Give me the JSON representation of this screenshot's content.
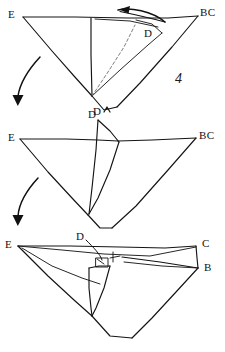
{
  "document": {
    "kind": "hand-drawn origami folding instruction sketch",
    "background_color": "#ffffff",
    "ink_color": "#141414",
    "crease_color": "#6e6e6e",
    "width": 225,
    "height": 352
  },
  "step_number": {
    "text": "4"
  },
  "panels": [
    {
      "id": "panel-top",
      "name": "step-4-before-fold",
      "labels": [
        {
          "name": "vertex-label-e",
          "text": "E",
          "x": 8,
          "y": 14
        },
        {
          "name": "vertex-label-bc",
          "text": "BC",
          "x": 200,
          "y": 12
        },
        {
          "name": "vertex-label-d-flap",
          "text": "D",
          "x": 144,
          "y": 31
        },
        {
          "name": "vertex-label-d-bottom",
          "text": "D",
          "x": 96,
          "y": 107
        }
      ],
      "motion_arrow": {
        "name": "fold-direction-arrow-left",
        "direction": "left",
        "style": "curved-solid-head"
      }
    },
    {
      "id": "panel-middle",
      "name": "step-4-mid-fold",
      "labels": [
        {
          "name": "vertex-label-e",
          "text": "E",
          "x": 8,
          "y": 132
        },
        {
          "name": "vertex-label-bc",
          "text": "BC",
          "x": 200,
          "y": 131
        },
        {
          "name": "vertex-label-d",
          "text": "D",
          "x": 88,
          "y": 114
        }
      ]
    },
    {
      "id": "panel-bottom",
      "name": "step-4-result",
      "labels": [
        {
          "name": "vertex-label-e",
          "text": "E",
          "x": 6,
          "y": 243
        },
        {
          "name": "vertex-label-c",
          "text": "C",
          "x": 203,
          "y": 241
        },
        {
          "name": "vertex-label-b",
          "text": "B",
          "x": 205,
          "y": 266
        },
        {
          "name": "vertex-label-d",
          "text": "D",
          "x": 76,
          "y": 234
        }
      ]
    }
  ],
  "transition_arrows": [
    {
      "name": "transition-arrow-1",
      "direction": "down",
      "from_panel": "panel-top",
      "to_panel": "panel-middle"
    },
    {
      "name": "transition-arrow-2",
      "direction": "down",
      "from_panel": "panel-middle",
      "to_panel": "panel-bottom"
    }
  ]
}
